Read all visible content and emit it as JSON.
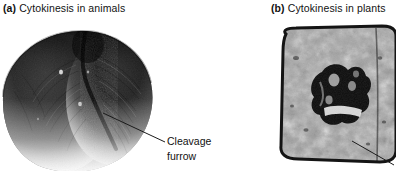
{
  "figure": {
    "background_color": "#ffffff",
    "text_color": "#121212"
  },
  "panels": [
    {
      "id": "a",
      "tag": "(a)",
      "caption": "Cytokinesis in animals",
      "image_kind": "scanning-electron-micrograph",
      "subject": "dividing animal cell constricted by a cleavage furrow",
      "annotations": [
        {
          "label_line_1": "Cleavage",
          "label_line_2": "furrow",
          "leader_line": "diagonal pointer from furrow groove down-right to label"
        }
      ]
    },
    {
      "id": "b",
      "tag": "(b)",
      "caption": "Cytokinesis in plants",
      "image_kind": "transmission-electron-micrograph",
      "subject": "rectangular plant cell with dark cell plate forming across the middle",
      "annotations": [
        {
          "label_line_1": "",
          "label_line_2": "",
          "leader_line": "diagonal pointer at lower right, cropped by figure edge"
        }
      ]
    }
  ],
  "colors": {
    "micrograph_dark": "#111111",
    "micrograph_mid": "#7d7d7d",
    "micrograph_light": "#e9e9e9",
    "leader_line": "#1b1b1b"
  }
}
